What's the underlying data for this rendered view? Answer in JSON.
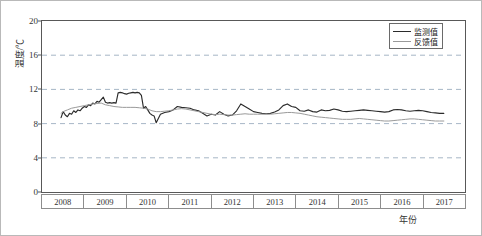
{
  "chart_data": {
    "type": "line",
    "title": "",
    "xlabel": "年份",
    "ylabel": "温度/℃",
    "ylim": [
      0,
      20
    ],
    "yticks": [
      0,
      4,
      8,
      12,
      16,
      20
    ],
    "xlim": [
      2008,
      2018
    ],
    "categories": [
      "2008",
      "2009",
      "2010",
      "2011",
      "2012",
      "2013",
      "2014",
      "2015",
      "2016",
      "2017"
    ],
    "grid": "horizontal-dashed",
    "legend_position": "top-right",
    "colors": {
      "monitored": "#2b2b2b",
      "feedback": "#9a9a9a",
      "grid": "#8fa3b8",
      "axis": "#585858",
      "frame": "#b9b9b9"
    },
    "series": [
      {
        "name": "监测值",
        "color": "#2b2b2b",
        "x": [
          2008.45,
          2008.5,
          2008.55,
          2008.6,
          2008.65,
          2008.7,
          2008.75,
          2008.8,
          2008.85,
          2008.9,
          2008.95,
          2009.0,
          2009.05,
          2009.1,
          2009.15,
          2009.2,
          2009.25,
          2009.3,
          2009.35,
          2009.4,
          2009.45,
          2009.5,
          2009.55,
          2009.6,
          2009.65,
          2009.7,
          2009.75,
          2009.8,
          2009.85,
          2009.9,
          2009.95,
          2010.0,
          2010.05,
          2010.1,
          2010.15,
          2010.2,
          2010.25,
          2010.3,
          2010.35,
          2010.4,
          2010.45,
          2010.5,
          2010.55,
          2010.6,
          2010.65,
          2010.7,
          2010.8,
          2010.9,
          2011.0,
          2011.1,
          2011.2,
          2011.3,
          2011.4,
          2011.5,
          2011.6,
          2011.7,
          2011.8,
          2011.9,
          2012.0,
          2012.1,
          2012.2,
          2012.3,
          2012.4,
          2012.5,
          2012.6,
          2012.7,
          2012.8,
          2012.9,
          2013.0,
          2013.1,
          2013.2,
          2013.3,
          2013.4,
          2013.5,
          2013.6,
          2013.7,
          2013.8,
          2013.9,
          2014.0,
          2014.1,
          2014.2,
          2014.3,
          2014.4,
          2014.5,
          2014.6,
          2014.7,
          2014.8,
          2014.9,
          2015.0,
          2015.1,
          2015.2,
          2015.3,
          2015.4,
          2015.5,
          2015.6,
          2015.7,
          2015.8,
          2015.9,
          2016.0,
          2016.1,
          2016.2,
          2016.3,
          2016.4,
          2016.5,
          2016.6,
          2016.7,
          2016.8,
          2016.9,
          2017.0,
          2017.1,
          2017.2,
          2017.3,
          2017.4,
          2017.5
        ],
        "values": [
          8.7,
          9.4,
          9.0,
          8.8,
          9.2,
          9.1,
          9.5,
          9.3,
          9.6,
          9.5,
          9.8,
          10.0,
          9.9,
          10.2,
          10.1,
          10.4,
          10.3,
          10.6,
          10.5,
          10.8,
          11.1,
          10.5,
          10.4,
          10.45,
          10.4,
          10.45,
          10.4,
          11.6,
          11.65,
          11.6,
          11.5,
          11.45,
          11.55,
          11.6,
          11.65,
          11.6,
          11.65,
          11.6,
          11.3,
          9.8,
          10.0,
          9.6,
          9.2,
          9.0,
          8.9,
          8.1,
          9.1,
          9.3,
          9.4,
          9.6,
          10.0,
          9.9,
          9.85,
          9.8,
          9.6,
          9.5,
          9.2,
          8.9,
          9.1,
          9.0,
          9.4,
          9.1,
          8.9,
          9.0,
          9.5,
          10.3,
          10.0,
          9.7,
          9.4,
          9.3,
          9.2,
          9.15,
          9.2,
          9.35,
          9.6,
          10.1,
          10.3,
          10.0,
          9.9,
          9.5,
          9.45,
          9.6,
          9.4,
          9.35,
          9.6,
          9.5,
          9.55,
          9.7,
          9.6,
          9.45,
          9.4,
          9.45,
          9.5,
          9.55,
          9.6,
          9.55,
          9.5,
          9.45,
          9.4,
          9.35,
          9.4,
          9.6,
          9.65,
          9.6,
          9.5,
          9.45,
          9.5,
          9.55,
          9.5,
          9.4,
          9.3,
          9.25,
          9.2,
          9.2
        ]
      },
      {
        "name": "反馈值",
        "color": "#9a9a9a",
        "x": [
          2008.45,
          2008.5,
          2008.6,
          2008.7,
          2008.8,
          2008.9,
          2009.0,
          2009.1,
          2009.2,
          2009.3,
          2009.4,
          2009.5,
          2009.6,
          2009.7,
          2009.8,
          2009.9,
          2010.0,
          2010.1,
          2010.2,
          2010.3,
          2010.4,
          2010.5,
          2010.6,
          2010.7,
          2010.8,
          2010.9,
          2011.0,
          2011.1,
          2011.2,
          2011.3,
          2011.4,
          2011.5,
          2011.6,
          2011.7,
          2011.8,
          2011.9,
          2012.0,
          2012.1,
          2012.2,
          2012.3,
          2012.4,
          2012.5,
          2012.6,
          2012.7,
          2012.8,
          2012.9,
          2013.0,
          2013.1,
          2013.2,
          2013.3,
          2013.4,
          2013.5,
          2013.6,
          2013.7,
          2013.8,
          2013.9,
          2014.0,
          2014.1,
          2014.2,
          2014.3,
          2014.4,
          2014.5,
          2014.6,
          2014.7,
          2014.8,
          2014.9,
          2015.0,
          2015.1,
          2015.2,
          2015.3,
          2015.4,
          2015.5,
          2015.6,
          2015.7,
          2015.8,
          2015.9,
          2016.0,
          2016.1,
          2016.2,
          2016.3,
          2016.4,
          2016.5,
          2016.6,
          2016.7,
          2016.8,
          2016.9,
          2017.0,
          2017.1,
          2017.2,
          2017.3,
          2017.4,
          2017.5
        ],
        "values": [
          9.2,
          9.4,
          9.6,
          9.8,
          9.9,
          10.0,
          10.1,
          10.2,
          10.3,
          10.35,
          10.4,
          10.2,
          10.1,
          10.0,
          9.95,
          9.9,
          9.9,
          9.9,
          9.9,
          9.85,
          9.8,
          9.7,
          9.5,
          9.4,
          9.4,
          9.45,
          9.5,
          9.6,
          9.7,
          9.75,
          9.7,
          9.6,
          9.5,
          9.4,
          9.3,
          9.2,
          9.1,
          9.05,
          9.1,
          9.05,
          9.0,
          9.0,
          9.05,
          9.1,
          9.15,
          9.1,
          9.1,
          9.1,
          9.1,
          9.1,
          9.1,
          9.15,
          9.2,
          9.25,
          9.3,
          9.3,
          9.25,
          9.2,
          9.1,
          9.0,
          8.9,
          8.8,
          8.75,
          8.7,
          8.65,
          8.6,
          8.55,
          8.5,
          8.5,
          8.5,
          8.55,
          8.6,
          8.55,
          8.5,
          8.45,
          8.4,
          8.35,
          8.3,
          8.3,
          8.35,
          8.4,
          8.45,
          8.5,
          8.55,
          8.55,
          8.5,
          8.45,
          8.4,
          8.35,
          8.3,
          8.3,
          8.3
        ]
      }
    ]
  },
  "legend": {
    "items": [
      {
        "label": "监测值"
      },
      {
        "label": "反馈值"
      }
    ]
  },
  "axes": {
    "y_title": "温度/℃",
    "x_title": "年份",
    "y_tick_labels": [
      "20",
      "16",
      "12",
      "8",
      "4",
      "0"
    ],
    "x_tick_labels": [
      "2008",
      "2009",
      "2010",
      "2011",
      "2012",
      "2013",
      "2014",
      "2015",
      "2016",
      "2017"
    ]
  }
}
